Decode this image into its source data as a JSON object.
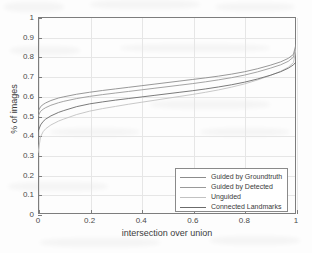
{
  "chart_data": {
    "type": "line",
    "title": "",
    "subtitle": "",
    "xlabel": "intersection over union",
    "ylabel": "% of images",
    "xlim": [
      0,
      1
    ],
    "ylim": [
      0,
      1
    ],
    "xticks": [
      "0",
      "0.2",
      "0.4",
      "0.6",
      "0.8",
      "1"
    ],
    "xtick_values": [
      0,
      0.2,
      0.4,
      0.6,
      0.8,
      1
    ],
    "yticks": [
      "0",
      "0.1",
      "0.2",
      "0.3",
      "0.4",
      "0.5",
      "0.6",
      "0.7",
      "0.8",
      "0.9",
      "1"
    ],
    "ytick_values": [
      0,
      0.1,
      0.2,
      0.3,
      0.4,
      0.5,
      0.6,
      0.7,
      0.8,
      0.9,
      1
    ],
    "grid": true,
    "legend_position": "lower right",
    "x": [
      0,
      0.01,
      0.02,
      0.03,
      0.05,
      0.08,
      0.1,
      0.15,
      0.2,
      0.25,
      0.3,
      0.35,
      0.4,
      0.45,
      0.5,
      0.55,
      0.6,
      0.65,
      0.7,
      0.75,
      0.8,
      0.85,
      0.9,
      0.94,
      0.97,
      0.99,
      1
    ],
    "series": [
      {
        "name": "Guided by Groundtruth",
        "color": "#8c8c8c",
        "values": [
          0.52,
          0.545,
          0.556,
          0.564,
          0.576,
          0.589,
          0.595,
          0.608,
          0.618,
          0.627,
          0.635,
          0.643,
          0.651,
          0.659,
          0.667,
          0.675,
          0.683,
          0.691,
          0.7,
          0.71,
          0.722,
          0.737,
          0.755,
          0.772,
          0.79,
          0.81,
          0.862
        ]
      },
      {
        "name": "Guided by Detected",
        "color": "#9a9a9a",
        "values": [
          0.497,
          0.521,
          0.532,
          0.54,
          0.552,
          0.565,
          0.572,
          0.586,
          0.597,
          0.606,
          0.614,
          0.622,
          0.63,
          0.638,
          0.646,
          0.654,
          0.662,
          0.671,
          0.681,
          0.692,
          0.705,
          0.721,
          0.74,
          0.757,
          0.775,
          0.796,
          0.85
        ]
      },
      {
        "name": "Unguided",
        "color": "#c2c2c2",
        "values": [
          0.31,
          0.392,
          0.418,
          0.433,
          0.452,
          0.472,
          0.482,
          0.505,
          0.522,
          0.535,
          0.546,
          0.557,
          0.567,
          0.577,
          0.587,
          0.597,
          0.607,
          0.618,
          0.63,
          0.644,
          0.66,
          0.68,
          0.703,
          0.724,
          0.745,
          0.768,
          0.838
        ]
      },
      {
        "name": "Connected Landmarks",
        "color": "#6b6b6b",
        "values": [
          0.418,
          0.452,
          0.47,
          0.482,
          0.498,
          0.516,
          0.525,
          0.545,
          0.559,
          0.569,
          0.578,
          0.586,
          0.594,
          0.602,
          0.61,
          0.618,
          0.626,
          0.635,
          0.645,
          0.656,
          0.669,
          0.685,
          0.704,
          0.722,
          0.74,
          0.757,
          0.772
        ]
      }
    ]
  },
  "legend": {
    "items": [
      {
        "label": "Guided by Groundtruth"
      },
      {
        "label": "Guided by Detected"
      },
      {
        "label": "Unguided"
      },
      {
        "label": "Connected Landmarks"
      }
    ]
  }
}
